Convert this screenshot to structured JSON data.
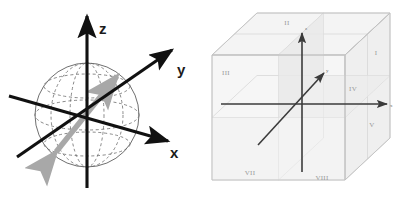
{
  "figure": {
    "background_color": "#ffffff",
    "panels": [
      {
        "id": "sphere-panel",
        "caption": "3D Cartesian coordinate axes with wireframe sphere and gray double-headed vector"
      },
      {
        "id": "cube-panel",
        "caption": "Transparent cube divided into eight octants labeled with Roman numerals"
      }
    ]
  },
  "sphere_diagram": {
    "axis_color": "#111111",
    "sphere_outline_color": "#5a5a5a",
    "grid_color": "#6b6b6b",
    "vector_color": "#a8a8a8",
    "axes": [
      {
        "name": "z-axis",
        "label": "z",
        "direction": "up"
      },
      {
        "name": "y-axis",
        "label": "y",
        "direction": "upper-right"
      },
      {
        "name": "x-axis",
        "label": "x",
        "direction": "lower-right"
      }
    ],
    "vector": {
      "name": "double-headed-vector",
      "style": "double-headed arrow",
      "color": "#a8a8a8"
    }
  },
  "cube_diagram": {
    "face_fill": "#f2f2f2",
    "edge_color": "#c9c9c9",
    "axis_color": "#3b3b3b",
    "label_color": "#9a9a9a",
    "octants": [
      {
        "numeral": "I",
        "position": "right-upper-front"
      },
      {
        "numeral": "II",
        "position": "top-back-left"
      },
      {
        "numeral": "III",
        "position": "left-upper-front"
      },
      {
        "numeral": "IV",
        "position": "right-upper-inner"
      },
      {
        "numeral": "V",
        "position": "right-lower-front"
      },
      {
        "numeral": "VII",
        "position": "left-lower-front"
      },
      {
        "numeral": "VIII",
        "position": "bottom-front-center"
      }
    ],
    "axes": [
      {
        "name": "z-axis",
        "label": "z",
        "direction": "up"
      },
      {
        "name": "x-axis",
        "label": "x",
        "direction": "right"
      },
      {
        "name": "y-axis",
        "label": "y",
        "direction": "diagonal-up-right"
      }
    ]
  }
}
